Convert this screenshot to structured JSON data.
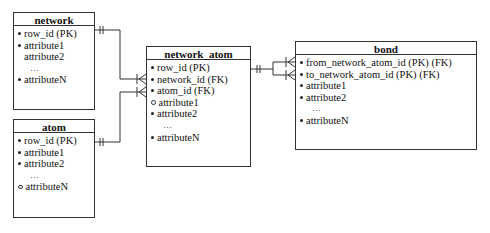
{
  "diagram": {
    "type": "entity-relationship",
    "entities": [
      {
        "name": "network",
        "attributes": [
          {
            "label": "row_id  (PK)",
            "bullet": "filled"
          },
          {
            "label": "attribute1",
            "bullet": "filled"
          },
          {
            "label": "attribute2",
            "bullet": "none"
          },
          {
            "label": "…",
            "bullet": "ellipsis"
          },
          {
            "label": "attributeN",
            "bullet": "filled"
          }
        ]
      },
      {
        "name": "atom",
        "attributes": [
          {
            "label": "row_id  (PK)",
            "bullet": "filled"
          },
          {
            "label": "attribute1",
            "bullet": "filled"
          },
          {
            "label": "attribute2",
            "bullet": "filled"
          },
          {
            "label": "…",
            "bullet": "ellipsis"
          },
          {
            "label": "attributeN",
            "bullet": "open"
          }
        ]
      },
      {
        "name": "network_atom",
        "attributes": [
          {
            "label": "row_id  (PK)",
            "bullet": "filled"
          },
          {
            "label": "network_id  (FK)",
            "bullet": "filled"
          },
          {
            "label": "atom_id  (FK)",
            "bullet": "filled"
          },
          {
            "label": "attribute1",
            "bullet": "open"
          },
          {
            "label": "attribute2",
            "bullet": "filled"
          },
          {
            "label": "…",
            "bullet": "ellipsis"
          },
          {
            "label": "attributeN",
            "bullet": "filled"
          }
        ]
      },
      {
        "name": "bond",
        "attributes": [
          {
            "label": "from_network_atom_id  (PK)  (FK)",
            "bullet": "filled"
          },
          {
            "label": "to_network_atom_id  (PK)  (FK)",
            "bullet": "filled"
          },
          {
            "label": "attribute1",
            "bullet": "filled"
          },
          {
            "label": "attribute2",
            "bullet": "filled"
          },
          {
            "label": "…",
            "bullet": "ellipsis"
          },
          {
            "label": "attributeN",
            "bullet": "filled"
          }
        ]
      }
    ],
    "relationships": [
      {
        "from": "network",
        "to": "network_atom",
        "from_card": "one-and-only-one",
        "to_card": "one-or-many"
      },
      {
        "from": "atom",
        "to": "network_atom",
        "from_card": "one-and-only-one",
        "to_card": "one-or-many"
      },
      {
        "from": "network_atom",
        "to": "bond",
        "from_card": "one-and-only-one",
        "to_card": "one-or-many",
        "count": 2
      }
    ]
  }
}
